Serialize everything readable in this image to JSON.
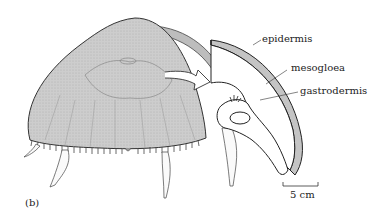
{
  "figure": {
    "panel_label": "(b)"
  },
  "labels": {
    "epidermis": "epidermis",
    "mesogloea": "mesogloea",
    "gastrodermis": "gastrodermis"
  },
  "scale_bar": {
    "label": "5 cm"
  },
  "colors": {
    "bell_fill": "#c9c9c9",
    "outline": "#333333",
    "background": "#ffffff"
  }
}
